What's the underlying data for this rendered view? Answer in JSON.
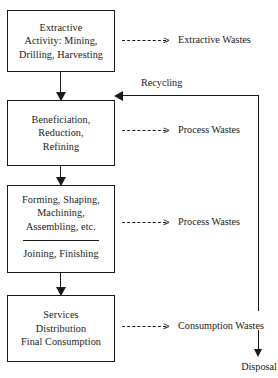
{
  "diagram": {
    "stroke_color": "#1a1a1a",
    "background_color": "#ffffff"
  },
  "stages": [
    {
      "id": "extraction",
      "lines": [
        "Extractive",
        "Activity: Mining,",
        "Drilling, Harvesting"
      ]
    },
    {
      "id": "beneficiation",
      "lines": [
        "Beneficiation,",
        "Reduction,",
        "Refining"
      ]
    },
    {
      "id": "manufacturing",
      "lines_top": [
        "Forming, Shaping,",
        "Machining,",
        "Assembling, etc."
      ],
      "lines_bottom": [
        "Joining, Finishing"
      ]
    },
    {
      "id": "consumption",
      "lines": [
        "Services",
        "Distribution",
        "Final Consumption"
      ]
    }
  ],
  "waste_streams": [
    {
      "id": "extractive",
      "label": "Extractive Wastes",
      "arrow": "dashed-arrow-right"
    },
    {
      "id": "process-1",
      "label": "Process Wastes",
      "arrow": "dashed-arrow-right"
    },
    {
      "id": "process-2",
      "label": "Process Wastes",
      "arrow": "dashed-arrow-right"
    },
    {
      "id": "consumption",
      "label": "Consumption Wastes",
      "arrow": "dashed-arrow-right"
    }
  ],
  "recycling": {
    "label": "Recycling",
    "arrow": "solid-arrow-left"
  },
  "disposal": {
    "label": "Disposal",
    "arrow": "solid-arrow-down"
  },
  "glyphs": {
    "arrow_head_right": ">"
  }
}
